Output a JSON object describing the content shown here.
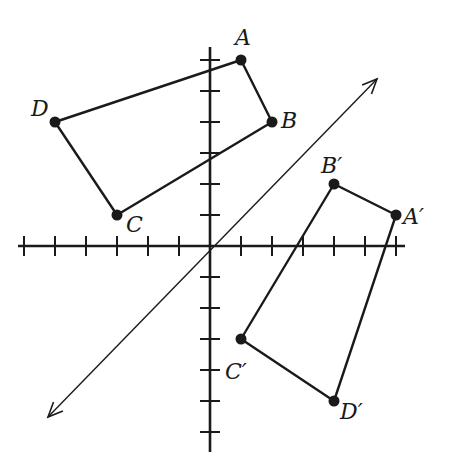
{
  "diagram": {
    "type": "coordinate-plane-reflection",
    "colors": {
      "ink": "#1a1a1a",
      "background": "#ffffff"
    },
    "grid": {
      "origin_px": [
        210,
        246
      ],
      "unit_px": 31,
      "x_ticks": [
        -6,
        -5,
        -4,
        -3,
        -2,
        -1,
        1,
        2,
        3,
        4,
        5,
        6
      ],
      "y_ticks": [
        -6,
        -5,
        -4,
        -3,
        -2,
        -1,
        1,
        2,
        3,
        4,
        5,
        6
      ],
      "x_axis_range_px": [
        18,
        405
      ],
      "y_axis_range_px": [
        47,
        452
      ]
    },
    "reflection_line": {
      "equation": "y = x",
      "arrow_start_px": [
        48,
        417
      ],
      "arrow_end_px": [
        377,
        79
      ]
    },
    "original": {
      "name": "ABCD",
      "vertices": [
        {
          "label": "A",
          "coord": [
            1,
            6
          ]
        },
        {
          "label": "B",
          "coord": [
            2,
            4
          ]
        },
        {
          "label": "C",
          "coord": [
            -3,
            1
          ]
        },
        {
          "label": "D",
          "coord": [
            -5,
            4
          ]
        }
      ]
    },
    "image": {
      "name": "A'B'C'D'",
      "vertices": [
        {
          "label": "A′",
          "coord": [
            6,
            1
          ]
        },
        {
          "label": "B′",
          "coord": [
            4,
            2
          ]
        },
        {
          "label": "C′",
          "coord": [
            1,
            -3
          ]
        },
        {
          "label": "D′",
          "coord": [
            4,
            -5
          ]
        }
      ]
    },
    "labels": {
      "A": "A",
      "B": "B",
      "C": "C",
      "D": "D",
      "A_prime": "A′",
      "B_prime": "B′",
      "C_prime": "C′",
      "D_prime": "D′"
    }
  }
}
